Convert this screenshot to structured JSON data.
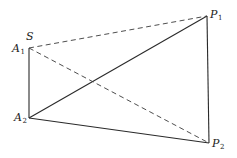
{
  "diagram": {
    "type": "geometric-figure",
    "width": 237,
    "height": 158,
    "stroke_color": "#2a2a2a",
    "points": {
      "A1": {
        "x": 29,
        "y": 48,
        "label": "A",
        "sub": "1"
      },
      "S": {
        "x": 29,
        "y": 48,
        "label": "S",
        "sub": ""
      },
      "A2": {
        "x": 29,
        "y": 118,
        "label": "A",
        "sub": "2"
      },
      "P1": {
        "x": 207,
        "y": 16,
        "label": "P",
        "sub": "1"
      },
      "P2": {
        "x": 209,
        "y": 143,
        "label": "P",
        "sub": "2"
      }
    },
    "solid_segments": [
      {
        "from": "A1",
        "to": "A2"
      },
      {
        "from": "A2",
        "to": "P1"
      },
      {
        "from": "A2",
        "to": "P2"
      },
      {
        "from": "P1",
        "to": "P2"
      }
    ],
    "dashed_segments": [
      {
        "from": "S",
        "to": "P1"
      },
      {
        "from": "S",
        "to": "P2"
      }
    ],
    "labels": {
      "S": {
        "text": "S",
        "sub": ""
      },
      "A1": {
        "text": "A",
        "sub": "1"
      },
      "A2": {
        "text": "A",
        "sub": "2"
      },
      "P1": {
        "text": "P",
        "sub": "1"
      },
      "P2": {
        "text": "P",
        "sub": "2"
      }
    }
  }
}
